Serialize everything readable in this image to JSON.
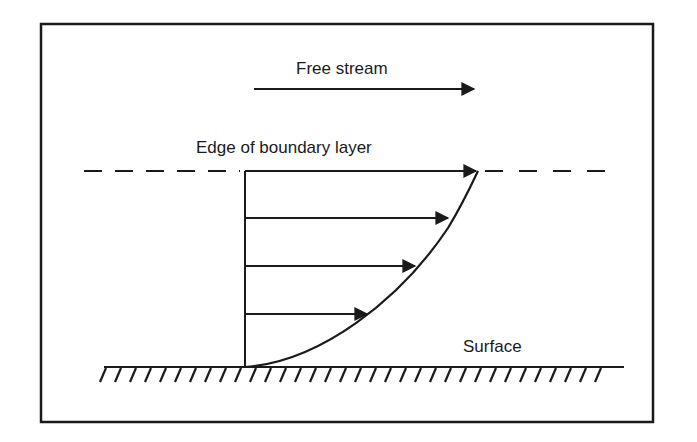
{
  "diagram": {
    "labels": {
      "free_stream": "Free stream",
      "edge": "Edge of boundary layer",
      "surface": "Surface"
    },
    "colors": {
      "ink": "#1a1a1a",
      "background": "#ffffff"
    },
    "velocity_arrows": [
      {
        "level": "edge",
        "y": 172,
        "x_end": 476
      },
      {
        "level": "upper",
        "y": 219,
        "x_end": 447
      },
      {
        "level": "middle",
        "y": 267,
        "x_end": 414
      },
      {
        "level": "lower",
        "y": 315,
        "x_end": 366
      }
    ]
  }
}
